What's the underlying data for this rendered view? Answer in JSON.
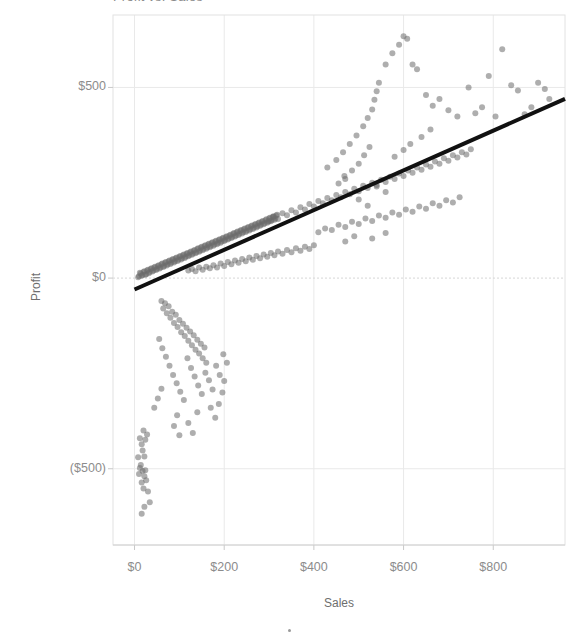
{
  "title": {
    "text": "Profit vs. Sales"
  },
  "axes": {
    "x_title": "Sales",
    "y_title": "Profit",
    "x_ticks": [
      "$0",
      "$200",
      "$400",
      "$600",
      "$800"
    ],
    "y_ticks": [
      "$500",
      "$0",
      "($500)"
    ]
  },
  "colors": {
    "marker": "#6b6b6b",
    "trendline": "#111111",
    "gridline": "#e9e9e9",
    "axis_text": "#8c8c8c",
    "plot_border": "#e2e2e2",
    "background": "#ffffff"
  },
  "chart_data": {
    "type": "scatter",
    "title": "Profit vs. Sales",
    "xlabel": "Sales",
    "ylabel": "Profit",
    "xlim": [
      -48,
      960
    ],
    "ylim": [
      -700,
      690
    ],
    "x_tick_values": [
      0,
      200,
      400,
      600,
      800
    ],
    "y_tick_values": [
      500,
      0,
      -500
    ],
    "grid": true,
    "legend": "none",
    "marker_style": {
      "shape": "circle",
      "size": 6,
      "color": "#6b6b6b",
      "opacity": 0.55
    },
    "trendline": {
      "type": "linear",
      "color": "#111111",
      "width": 4,
      "x_start": 0,
      "y_start": -30,
      "x_end": 960,
      "y_end": 470,
      "slope": 0.52,
      "intercept": -30
    },
    "points": [
      [
        10,
        5
      ],
      [
        14,
        12
      ],
      [
        18,
        8
      ],
      [
        22,
        18
      ],
      [
        26,
        10
      ],
      [
        30,
        22
      ],
      [
        34,
        16
      ],
      [
        38,
        26
      ],
      [
        42,
        20
      ],
      [
        46,
        30
      ],
      [
        50,
        24
      ],
      [
        54,
        34
      ],
      [
        58,
        28
      ],
      [
        62,
        38
      ],
      [
        66,
        32
      ],
      [
        70,
        42
      ],
      [
        74,
        36
      ],
      [
        78,
        46
      ],
      [
        82,
        40
      ],
      [
        86,
        50
      ],
      [
        90,
        44
      ],
      [
        94,
        54
      ],
      [
        98,
        48
      ],
      [
        102,
        58
      ],
      [
        106,
        52
      ],
      [
        110,
        62
      ],
      [
        114,
        56
      ],
      [
        118,
        66
      ],
      [
        122,
        60
      ],
      [
        126,
        70
      ],
      [
        130,
        64
      ],
      [
        134,
        74
      ],
      [
        138,
        68
      ],
      [
        142,
        78
      ],
      [
        146,
        72
      ],
      [
        150,
        82
      ],
      [
        154,
        76
      ],
      [
        158,
        86
      ],
      [
        162,
        80
      ],
      [
        166,
        90
      ],
      [
        170,
        84
      ],
      [
        174,
        94
      ],
      [
        178,
        88
      ],
      [
        182,
        98
      ],
      [
        186,
        92
      ],
      [
        190,
        102
      ],
      [
        194,
        96
      ],
      [
        198,
        106
      ],
      [
        202,
        100
      ],
      [
        206,
        110
      ],
      [
        210,
        104
      ],
      [
        214,
        114
      ],
      [
        218,
        108
      ],
      [
        222,
        118
      ],
      [
        226,
        112
      ],
      [
        230,
        122
      ],
      [
        234,
        116
      ],
      [
        238,
        126
      ],
      [
        242,
        120
      ],
      [
        246,
        130
      ],
      [
        250,
        124
      ],
      [
        254,
        134
      ],
      [
        258,
        128
      ],
      [
        262,
        138
      ],
      [
        266,
        132
      ],
      [
        270,
        142
      ],
      [
        274,
        136
      ],
      [
        278,
        146
      ],
      [
        282,
        140
      ],
      [
        286,
        150
      ],
      [
        290,
        144
      ],
      [
        294,
        154
      ],
      [
        298,
        148
      ],
      [
        302,
        158
      ],
      [
        306,
        152
      ],
      [
        310,
        162
      ],
      [
        314,
        156
      ],
      [
        318,
        166
      ],
      [
        8,
        2
      ],
      [
        12,
        14
      ],
      [
        16,
        6
      ],
      [
        20,
        16
      ],
      [
        24,
        9
      ],
      [
        28,
        20
      ],
      [
        32,
        13
      ],
      [
        36,
        24
      ],
      [
        40,
        17
      ],
      [
        44,
        28
      ],
      [
        48,
        21
      ],
      [
        52,
        32
      ],
      [
        56,
        25
      ],
      [
        60,
        36
      ],
      [
        64,
        29
      ],
      [
        68,
        40
      ],
      [
        72,
        33
      ],
      [
        76,
        44
      ],
      [
        80,
        37
      ],
      [
        84,
        48
      ],
      [
        88,
        41
      ],
      [
        92,
        52
      ],
      [
        96,
        45
      ],
      [
        100,
        56
      ],
      [
        104,
        49
      ],
      [
        108,
        60
      ],
      [
        112,
        53
      ],
      [
        116,
        64
      ],
      [
        120,
        57
      ],
      [
        124,
        68
      ],
      [
        128,
        61
      ],
      [
        132,
        72
      ],
      [
        136,
        65
      ],
      [
        140,
        76
      ],
      [
        144,
        69
      ],
      [
        148,
        80
      ],
      [
        152,
        73
      ],
      [
        156,
        84
      ],
      [
        160,
        77
      ],
      [
        164,
        88
      ],
      [
        168,
        81
      ],
      [
        172,
        92
      ],
      [
        176,
        85
      ],
      [
        180,
        96
      ],
      [
        184,
        89
      ],
      [
        188,
        100
      ],
      [
        192,
        93
      ],
      [
        196,
        104
      ],
      [
        200,
        97
      ],
      [
        204,
        108
      ],
      [
        208,
        101
      ],
      [
        212,
        112
      ],
      [
        216,
        105
      ],
      [
        220,
        116
      ],
      [
        224,
        109
      ],
      [
        228,
        120
      ],
      [
        232,
        113
      ],
      [
        236,
        124
      ],
      [
        240,
        117
      ],
      [
        244,
        128
      ],
      [
        248,
        121
      ],
      [
        252,
        132
      ],
      [
        256,
        125
      ],
      [
        260,
        136
      ],
      [
        264,
        129
      ],
      [
        268,
        140
      ],
      [
        272,
        133
      ],
      [
        276,
        144
      ],
      [
        280,
        137
      ],
      [
        284,
        148
      ],
      [
        288,
        141
      ],
      [
        292,
        152
      ],
      [
        296,
        145
      ],
      [
        300,
        156
      ],
      [
        304,
        149
      ],
      [
        308,
        160
      ],
      [
        312,
        153
      ],
      [
        316,
        164
      ],
      [
        120,
        20
      ],
      [
        128,
        24
      ],
      [
        136,
        18
      ],
      [
        144,
        28
      ],
      [
        152,
        22
      ],
      [
        160,
        30
      ],
      [
        168,
        26
      ],
      [
        176,
        34
      ],
      [
        184,
        28
      ],
      [
        192,
        38
      ],
      [
        200,
        32
      ],
      [
        208,
        42
      ],
      [
        216,
        36
      ],
      [
        224,
        46
      ],
      [
        232,
        40
      ],
      [
        240,
        50
      ],
      [
        248,
        44
      ],
      [
        256,
        54
      ],
      [
        264,
        48
      ],
      [
        272,
        58
      ],
      [
        280,
        52
      ],
      [
        288,
        62
      ],
      [
        296,
        56
      ],
      [
        304,
        66
      ],
      [
        312,
        60
      ],
      [
        320,
        70
      ],
      [
        330,
        64
      ],
      [
        340,
        74
      ],
      [
        350,
        68
      ],
      [
        360,
        78
      ],
      [
        370,
        72
      ],
      [
        380,
        82
      ],
      [
        390,
        76
      ],
      [
        400,
        86
      ],
      [
        300,
        150
      ],
      [
        310,
        160
      ],
      [
        320,
        155
      ],
      [
        330,
        170
      ],
      [
        340,
        165
      ],
      [
        350,
        178
      ],
      [
        360,
        172
      ],
      [
        370,
        186
      ],
      [
        380,
        180
      ],
      [
        390,
        194
      ],
      [
        400,
        188
      ],
      [
        410,
        202
      ],
      [
        420,
        196
      ],
      [
        430,
        210
      ],
      [
        440,
        204
      ],
      [
        450,
        218
      ],
      [
        460,
        212
      ],
      [
        470,
        226
      ],
      [
        480,
        220
      ],
      [
        490,
        234
      ],
      [
        500,
        228
      ],
      [
        510,
        242
      ],
      [
        520,
        236
      ],
      [
        530,
        250
      ],
      [
        540,
        244
      ],
      [
        550,
        258
      ],
      [
        560,
        252
      ],
      [
        570,
        266
      ],
      [
        580,
        260
      ],
      [
        590,
        274
      ],
      [
        600,
        268
      ],
      [
        610,
        282
      ],
      [
        620,
        276
      ],
      [
        630,
        290
      ],
      [
        640,
        284
      ],
      [
        650,
        298
      ],
      [
        660,
        292
      ],
      [
        670,
        306
      ],
      [
        680,
        300
      ],
      [
        690,
        314
      ],
      [
        700,
        308
      ],
      [
        710,
        322
      ],
      [
        720,
        316
      ],
      [
        730,
        330
      ],
      [
        740,
        324
      ],
      [
        750,
        338
      ],
      [
        410,
        120
      ],
      [
        425,
        130
      ],
      [
        440,
        126
      ],
      [
        455,
        140
      ],
      [
        470,
        134
      ],
      [
        485,
        148
      ],
      [
        500,
        142
      ],
      [
        515,
        156
      ],
      [
        530,
        150
      ],
      [
        545,
        164
      ],
      [
        560,
        158
      ],
      [
        575,
        172
      ],
      [
        590,
        166
      ],
      [
        605,
        180
      ],
      [
        620,
        174
      ],
      [
        635,
        188
      ],
      [
        650,
        182
      ],
      [
        665,
        196
      ],
      [
        680,
        190
      ],
      [
        695,
        204
      ],
      [
        710,
        198
      ],
      [
        725,
        212
      ],
      [
        430,
        290
      ],
      [
        450,
        310
      ],
      [
        465,
        330
      ],
      [
        480,
        352
      ],
      [
        495,
        374
      ],
      [
        510,
        398
      ],
      [
        520,
        420
      ],
      [
        530,
        442
      ],
      [
        535,
        468
      ],
      [
        540,
        490
      ],
      [
        545,
        512
      ],
      [
        470,
        260
      ],
      [
        485,
        282
      ],
      [
        500,
        300
      ],
      [
        512,
        322
      ],
      [
        524,
        344
      ],
      [
        455,
        248
      ],
      [
        468,
        268
      ],
      [
        560,
        560
      ],
      [
        575,
        590
      ],
      [
        590,
        612
      ],
      [
        600,
        634
      ],
      [
        608,
        628
      ],
      [
        620,
        560
      ],
      [
        630,
        548
      ],
      [
        650,
        480
      ],
      [
        665,
        452
      ],
      [
        680,
        470
      ],
      [
        700,
        440
      ],
      [
        720,
        424
      ],
      [
        745,
        500
      ],
      [
        760,
        432
      ],
      [
        775,
        448
      ],
      [
        790,
        530
      ],
      [
        805,
        424
      ],
      [
        820,
        600
      ],
      [
        840,
        506
      ],
      [
        855,
        492
      ],
      [
        870,
        430
      ],
      [
        885,
        448
      ],
      [
        900,
        512
      ],
      [
        915,
        496
      ],
      [
        925,
        470
      ],
      [
        500,
        206
      ],
      [
        520,
        190
      ],
      [
        540,
        240
      ],
      [
        560,
        226
      ],
      [
        580,
        318
      ],
      [
        600,
        336
      ],
      [
        615,
        352
      ],
      [
        640,
        370
      ],
      [
        660,
        390
      ],
      [
        470,
        96
      ],
      [
        490,
        110
      ],
      [
        530,
        104
      ],
      [
        560,
        118
      ],
      [
        60,
        -60
      ],
      [
        64,
        -80
      ],
      [
        68,
        -66
      ],
      [
        72,
        -92
      ],
      [
        76,
        -74
      ],
      [
        80,
        -104
      ],
      [
        84,
        -88
      ],
      [
        88,
        -118
      ],
      [
        92,
        -96
      ],
      [
        96,
        -128
      ],
      [
        100,
        -110
      ],
      [
        104,
        -142
      ],
      [
        108,
        -120
      ],
      [
        112,
        -152
      ],
      [
        116,
        -130
      ],
      [
        120,
        -164
      ],
      [
        124,
        -140
      ],
      [
        128,
        -176
      ],
      [
        132,
        -150
      ],
      [
        136,
        -188
      ],
      [
        140,
        -162
      ],
      [
        144,
        -198
      ],
      [
        148,
        -172
      ],
      [
        152,
        -210
      ],
      [
        156,
        -182
      ],
      [
        160,
        -222
      ],
      [
        55,
        -160
      ],
      [
        62,
        -184
      ],
      [
        70,
        -206
      ],
      [
        78,
        -230
      ],
      [
        86,
        -254
      ],
      [
        94,
        -276
      ],
      [
        102,
        -298
      ],
      [
        110,
        -320
      ],
      [
        118,
        -210
      ],
      [
        126,
        -236
      ],
      [
        134,
        -258
      ],
      [
        142,
        -282
      ],
      [
        150,
        -304
      ],
      [
        158,
        -248
      ],
      [
        166,
        -268
      ],
      [
        174,
        -292
      ],
      [
        182,
        -230
      ],
      [
        190,
        -254
      ],
      [
        198,
        -200
      ],
      [
        206,
        -222
      ],
      [
        200,
        -270
      ],
      [
        196,
        -300
      ],
      [
        170,
        -340
      ],
      [
        180,
        -366
      ],
      [
        188,
        -330
      ],
      [
        120,
        -380
      ],
      [
        130,
        -406
      ],
      [
        140,
        -352
      ],
      [
        95,
        -360
      ],
      [
        88,
        -388
      ],
      [
        100,
        -412
      ],
      [
        60,
        -290
      ],
      [
        52,
        -316
      ],
      [
        44,
        -340
      ],
      [
        20,
        -400
      ],
      [
        24,
        -424
      ],
      [
        28,
        -410
      ],
      [
        16,
        -436
      ],
      [
        12,
        -420
      ],
      [
        18,
        -452
      ],
      [
        22,
        -468
      ],
      [
        14,
        -490
      ],
      [
        18,
        -506
      ],
      [
        22,
        -520
      ],
      [
        16,
        -536
      ],
      [
        20,
        -552
      ],
      [
        24,
        -504
      ],
      [
        12,
        -498
      ],
      [
        26,
        -530
      ],
      [
        30,
        -560
      ],
      [
        34,
        -588
      ],
      [
        22,
        -600
      ],
      [
        16,
        -618
      ],
      [
        8,
        -470
      ],
      [
        10,
        -514
      ]
    ]
  }
}
